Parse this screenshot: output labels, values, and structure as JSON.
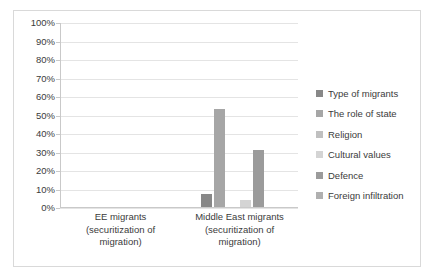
{
  "chart_data": {
    "type": "bar",
    "title": "",
    "xlabel": "",
    "ylabel": "",
    "ylim": [
      0,
      100
    ],
    "grid": true,
    "legend_position": "right",
    "categories": [
      "EE migrants\n(securitization of\nmigration)",
      "Middle East migrants\n(securitization of\nmigration)"
    ],
    "category_lines": [
      [
        "EE migrants",
        "(securitization of",
        "migration)"
      ],
      [
        "Middle East migrants",
        "(securitization of",
        "migration)"
      ]
    ],
    "ytick_labels": [
      "100%",
      "90%",
      "80%",
      "70%",
      "60%",
      "50%",
      "40%",
      "30%",
      "20%",
      "10%",
      "0%"
    ],
    "ytick_values": [
      100,
      90,
      80,
      70,
      60,
      50,
      40,
      30,
      20,
      10,
      0
    ],
    "series": [
      {
        "name": "Type of migrants",
        "color": "#888888",
        "values": [
          0,
          7
        ]
      },
      {
        "name": "The role of state",
        "color": "#a6a6a6",
        "values": [
          0,
          53
        ]
      },
      {
        "name": "Religion",
        "color": "#c0c0c0",
        "values": [
          0,
          0
        ]
      },
      {
        "name": "Cultural values",
        "color": "#d4d4d4",
        "values": [
          0,
          4
        ]
      },
      {
        "name": "Defence",
        "color": "#9b9b9b",
        "values": [
          0,
          31
        ]
      },
      {
        "name": "Foreign infiltration",
        "color": "#b0b0b0",
        "values": [
          0,
          0
        ]
      }
    ]
  },
  "style": {
    "border_color": "#d9d9d9",
    "gridline_color": "#e4e4e4",
    "axis_color": "#c9c9c9",
    "text_color": "#3b3b3b",
    "background": "#ffffff"
  }
}
